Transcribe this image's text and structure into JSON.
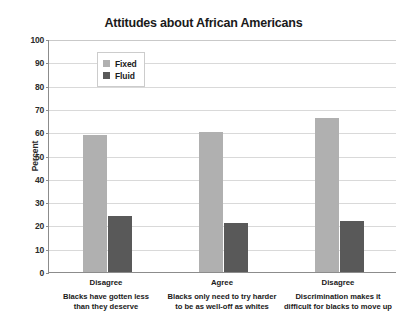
{
  "chart_data": {
    "type": "bar",
    "title": "Attitudes about African Americans",
    "xlabel": "",
    "ylabel": "Percent",
    "ylim": [
      0,
      100
    ],
    "ytick_step": 10,
    "yticks": [
      100,
      90,
      80,
      70,
      60,
      50,
      40,
      30,
      20,
      10,
      0
    ],
    "grid": true,
    "legend_position": "top-left-inside",
    "categories": [
      {
        "head": "Disagree",
        "sub_line1": "Blacks have gotten less",
        "sub_line2": "than they deserve"
      },
      {
        "head": "Agree",
        "sub_line1": "Blacks only need to try harder",
        "sub_line2": "to be as well-off as whites"
      },
      {
        "head": "Disagree",
        "sub_line1": "Discrimination makes it",
        "sub_line2": "difficult for blacks to move up"
      }
    ],
    "series": [
      {
        "name": "Fixed",
        "color": "#b0b0b0",
        "values": [
          59,
          60,
          66
        ]
      },
      {
        "name": "Fluid",
        "color": "#595959",
        "values": [
          24,
          21,
          22
        ]
      }
    ]
  },
  "legend": {
    "items": [
      {
        "label": "Fixed",
        "color": "#b0b0b0"
      },
      {
        "label": "Fluid",
        "color": "#595959"
      }
    ]
  },
  "colors": {
    "fixed": "#b0b0b0",
    "fluid": "#595959",
    "axis": "#8c8c8c",
    "grid": "#d9d9d9",
    "text": "#1a1a1a",
    "background": "#ffffff"
  }
}
